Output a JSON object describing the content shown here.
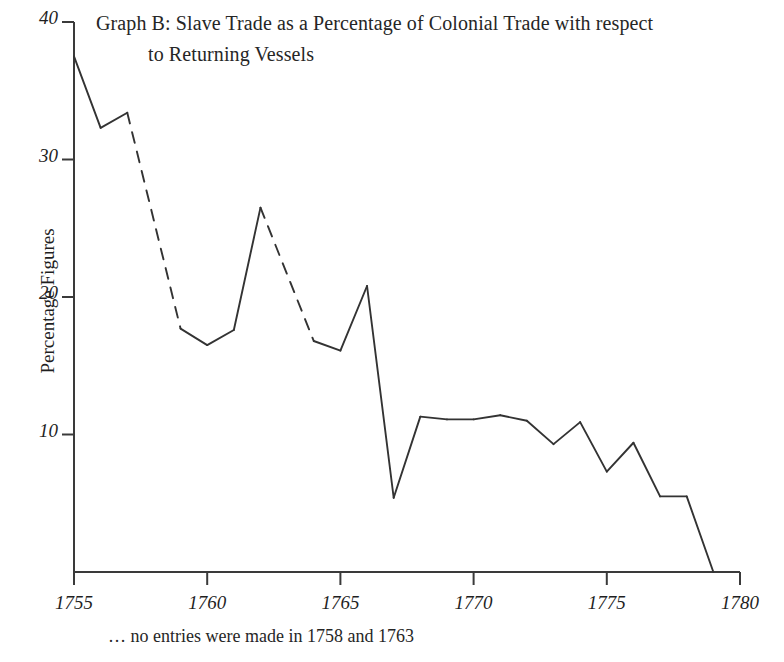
{
  "chart_data": {
    "type": "line",
    "title": "Graph B: Slave Trade as a Percentage of Colonial Trade with respect to Returning Vessels",
    "title_line1": "Graph B: Slave Trade as a Percentage of Colonial Trade with respect",
    "title_line2": "to Returning Vessels",
    "xlabel": "",
    "ylabel": "Percentage Figures",
    "xlim": [
      1755,
      1780
    ],
    "ylim": [
      0,
      40
    ],
    "grid": false,
    "legend": "none",
    "x_ticks": [
      "1755",
      "1760",
      "1765",
      "1770",
      "1775",
      "1780"
    ],
    "x_tick_values": [
      1755,
      1760,
      1765,
      1770,
      1775,
      1780
    ],
    "y_ticks": [
      "10",
      "20",
      "30",
      "40"
    ],
    "y_tick_values": [
      10,
      20,
      30,
      40
    ],
    "line_color": "#333333",
    "missing_years": [
      1758,
      1763
    ],
    "annotation": "… no entries were made in 1758 and 1763",
    "x": [
      1755,
      1756,
      1757,
      1759,
      1760,
      1761,
      1762,
      1764,
      1765,
      1766,
      1767,
      1768,
      1769,
      1770,
      1771,
      1772,
      1773,
      1774,
      1775,
      1776,
      1777,
      1778,
      1779
    ],
    "values": [
      37.5,
      32.3,
      33.4,
      17.7,
      16.5,
      17.6,
      26.5,
      16.8,
      16.1,
      20.8,
      5.4,
      11.3,
      11.1,
      11.1,
      11.4,
      11.0,
      9.3,
      10.9,
      7.3,
      9.4,
      5.5,
      5.5,
      0.0
    ],
    "dashed_segments": [
      [
        1757,
        1759
      ],
      [
        1762,
        1764
      ]
    ],
    "series": [
      {
        "name": "Slave trade percentage of colonial trade (returning vessels)",
        "points": [
          {
            "year": 1755,
            "value": 37.5
          },
          {
            "year": 1756,
            "value": 32.3
          },
          {
            "year": 1757,
            "value": 33.4
          },
          {
            "year": 1759,
            "value": 17.7
          },
          {
            "year": 1760,
            "value": 16.5
          },
          {
            "year": 1761,
            "value": 17.6
          },
          {
            "year": 1762,
            "value": 26.5
          },
          {
            "year": 1764,
            "value": 16.8
          },
          {
            "year": 1765,
            "value": 16.1
          },
          {
            "year": 1766,
            "value": 20.8
          },
          {
            "year": 1767,
            "value": 5.4
          },
          {
            "year": 1768,
            "value": 11.3
          },
          {
            "year": 1769,
            "value": 11.1
          },
          {
            "year": 1770,
            "value": 11.1
          },
          {
            "year": 1771,
            "value": 11.4
          },
          {
            "year": 1772,
            "value": 11.0
          },
          {
            "year": 1773,
            "value": 9.3
          },
          {
            "year": 1774,
            "value": 10.9
          },
          {
            "year": 1775,
            "value": 7.3
          },
          {
            "year": 1776,
            "value": 9.4
          },
          {
            "year": 1777,
            "value": 5.5
          },
          {
            "year": 1778,
            "value": 5.5
          },
          {
            "year": 1779,
            "value": 0.0
          }
        ]
      }
    ]
  },
  "footnote": "… no entries were made in 1758 and 1763"
}
